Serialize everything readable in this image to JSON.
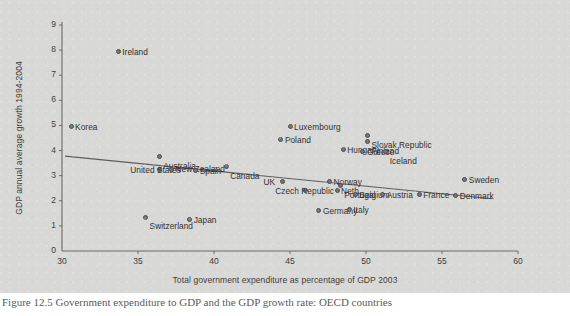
{
  "chart_data": {
    "type": "scatter",
    "title": "",
    "xlabel": "Total government expenditure as percentage of GDP 2003",
    "ylabel": "GDP annual average growth 1994-2004",
    "xlim": [
      30,
      60
    ],
    "ylim": [
      0,
      9
    ],
    "xticks": [
      30,
      35,
      40,
      45,
      50,
      55,
      60
    ],
    "yticks": [
      0,
      1,
      2,
      3,
      4,
      5,
      6,
      7,
      8,
      9
    ],
    "grid": false,
    "legend": "none",
    "marker_color": "#777777",
    "marker_edge_color": "#4a4a4a",
    "axis_color": "#6b6b6b",
    "points": [
      {
        "label": "Korea",
        "x": 30.6,
        "y": 4.95,
        "lx": -2,
        "ly": -4.5
      },
      {
        "label": "Ireland",
        "x": 33.7,
        "y": 7.95,
        "lx": -2,
        "ly": -4.5
      },
      {
        "label": "Australia",
        "x": 36.4,
        "y": 3.75,
        "lx": -2,
        "ly": 3.3
      },
      {
        "label": "United States",
        "x": 36.4,
        "y": 3.25,
        "lx": 25,
        "ly": -4.5
      },
      {
        "label": "New Zealand",
        "x": 37.2,
        "y": 3.25,
        "lx": -2,
        "ly": -5.2
      },
      {
        "label": "Switzerland",
        "x": 35.5,
        "y": 1.35,
        "lx": -2,
        "ly": 3.2
      },
      {
        "label": "Japan",
        "x": 38.4,
        "y": 1.25,
        "lx": -2,
        "ly": -4.5
      },
      {
        "label": "Spain",
        "x": 38.8,
        "y": 3.2,
        "lx": -2,
        "ly": -4.5
      },
      {
        "label": "Canada",
        "x": 40.8,
        "y": 3.35,
        "lx": -2,
        "ly": 3.4
      },
      {
        "label": "Luxembourg",
        "x": 45.0,
        "y": 4.95,
        "lx": -2,
        "ly": -4.5
      },
      {
        "label": "Poland",
        "x": 44.4,
        "y": 4.45,
        "lx": -2,
        "ly": -4.5
      },
      {
        "label": "UK",
        "x": 44.5,
        "y": 2.75,
        "lx": 15,
        "ly": -4.5
      },
      {
        "label": "Czech Republic",
        "x": 46.0,
        "y": 2.4,
        "lx": 26,
        "ly": -4.5
      },
      {
        "label": "Norway",
        "x": 47.6,
        "y": 2.75,
        "lx": -2,
        "ly": -4.5
      },
      {
        "label": "Neth.",
        "x": 48.1,
        "y": 2.4,
        "lx": -2,
        "ly": -4.5
      },
      {
        "label": "Hungary",
        "x": 48.5,
        "y": 4.05,
        "lx": -2,
        "ly": -4.5
      },
      {
        "label": "Germany",
        "x": 46.9,
        "y": 1.6,
        "lx": -2,
        "ly": -4.5
      },
      {
        "label": "Portugal",
        "x": 48.3,
        "y": 2.6,
        "lx": -2,
        "ly": 3.2
      },
      {
        "label": "Belgium",
        "x": 49.3,
        "y": 2.25,
        "lx": -2,
        "ly": -4.5
      },
      {
        "label": "Italy",
        "x": 48.9,
        "y": 1.65,
        "lx": -2,
        "ly": -4.5
      },
      {
        "label": "Finland",
        "x": 50.1,
        "y": 4.35,
        "lx": -2,
        "ly": 3.3
      },
      {
        "label": "Slovak Republic",
        "x": 50.1,
        "y": 4.6,
        "lx": -2,
        "ly": 3.3
      },
      {
        "label": "Greece",
        "x": 49.8,
        "y": 3.95,
        "lx": -2,
        "ly": -4.5
      },
      {
        "label": "Iceland",
        "x": 51.3,
        "y": 3.95,
        "lx": -2,
        "ly": 3.2
      },
      {
        "label": "Austria",
        "x": 51.1,
        "y": 2.25,
        "lx": -2,
        "ly": -4.5
      },
      {
        "label": "France",
        "x": 53.5,
        "y": 2.25,
        "lx": -2,
        "ly": -4.5
      },
      {
        "label": "Denmark",
        "x": 55.9,
        "y": 2.2,
        "lx": -2,
        "ly": -4.8
      },
      {
        "label": "Sweden",
        "x": 56.5,
        "y": 2.85,
        "lx": -2,
        "ly": -4.5
      }
    ],
    "trendline": {
      "x0": 30.2,
      "y0": 3.78,
      "x1": 58.3,
      "y1": 2.08
    }
  },
  "caption": {
    "text": "Figure 12.5 Government expenditure to GDP and the GDP growth rate: OECD countries"
  }
}
